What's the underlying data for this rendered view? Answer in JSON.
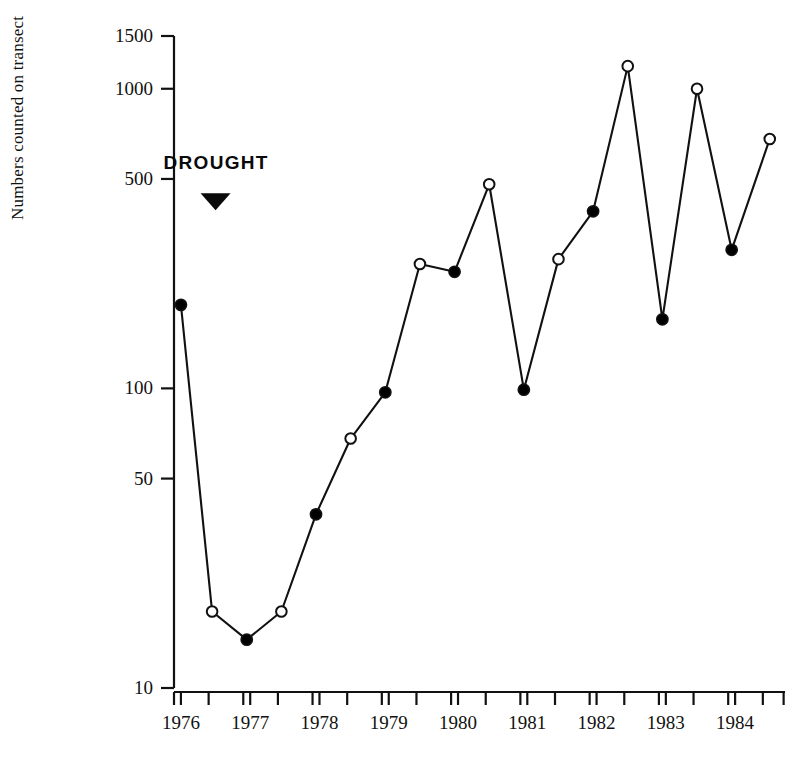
{
  "chart_data": {
    "type": "line",
    "title": "",
    "xlabel": "",
    "ylabel": "Numbers counted on transect",
    "yscale": "log",
    "ylim": [
      10,
      1500
    ],
    "xlim": [
      1975.75,
      1984.75
    ],
    "grid": false,
    "legend": null,
    "ytick_labels": [
      "1500",
      "1000",
      "500",
      "100",
      "50",
      "10"
    ],
    "ytick_values": [
      1500,
      1000,
      500,
      100,
      50,
      10
    ],
    "xtick_labels": [
      "1976",
      "1977",
      "1978",
      "1979",
      "1980",
      "1981",
      "1982",
      "1983",
      "1984"
    ],
    "xtick_values": [
      1976,
      1977,
      1978,
      1979,
      1980,
      1981,
      1982,
      1983,
      1984
    ],
    "minor_xticks": [
      1975.9,
      1976.4,
      1976.9,
      1977.4,
      1977.9,
      1978.4,
      1978.9,
      1979.4,
      1979.9,
      1980.4,
      1980.9,
      1981.4,
      1981.9,
      1982.4,
      1982.9,
      1983.4,
      1983.9,
      1984.4,
      1984.7
    ],
    "series": [
      {
        "name": "Numbers counted on transect",
        "marker_styles": [
          "filled",
          "open",
          "filled",
          "open",
          "filled",
          "open",
          "filled",
          "open",
          "filled",
          "open",
          "filled",
          "open",
          "filled",
          "open",
          "filled",
          "open",
          "filled",
          "open"
        ],
        "points": [
          {
            "x": 1976.0,
            "y": 190,
            "marker": "filled"
          },
          {
            "x": 1976.45,
            "y": 18,
            "marker": "open"
          },
          {
            "x": 1976.95,
            "y": 14.5,
            "marker": "filled"
          },
          {
            "x": 1977.45,
            "y": 18,
            "marker": "open"
          },
          {
            "x": 1977.95,
            "y": 38,
            "marker": "filled"
          },
          {
            "x": 1978.45,
            "y": 68,
            "marker": "open"
          },
          {
            "x": 1978.95,
            "y": 97,
            "marker": "filled"
          },
          {
            "x": 1979.45,
            "y": 260,
            "marker": "open"
          },
          {
            "x": 1979.95,
            "y": 245,
            "marker": "filled"
          },
          {
            "x": 1980.45,
            "y": 480,
            "marker": "open"
          },
          {
            "x": 1980.95,
            "y": 99,
            "marker": "filled"
          },
          {
            "x": 1981.45,
            "y": 270,
            "marker": "open"
          },
          {
            "x": 1981.95,
            "y": 390,
            "marker": "filled"
          },
          {
            "x": 1982.45,
            "y": 1190,
            "marker": "open"
          },
          {
            "x": 1982.95,
            "y": 170,
            "marker": "filled"
          },
          {
            "x": 1983.45,
            "y": 1000,
            "marker": "open"
          },
          {
            "x": 1983.95,
            "y": 290,
            "marker": "filled"
          },
          {
            "x": 1984.5,
            "y": 680,
            "marker": "open"
          }
        ]
      }
    ],
    "annotations": [
      {
        "name": "drought",
        "label": "DROUGHT",
        "marker": "down-triangle",
        "x": 1976.5,
        "y_label": 560,
        "y_marker": 420
      }
    ],
    "colors": {
      "line": "#111111",
      "marker_fill": "#000000",
      "marker_open_fill": "#ffffff",
      "axis": "#111111",
      "background": "#ffffff"
    }
  }
}
